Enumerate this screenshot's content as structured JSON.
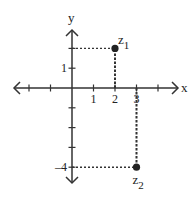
{
  "diagram": {
    "title": "",
    "axes": {
      "x_label": "x",
      "y_label": "y",
      "x_range": [
        -3,
        5
      ],
      "y_range": [
        -5,
        3
      ],
      "x_ticks": [
        -2,
        -1,
        1,
        2,
        3,
        4
      ],
      "y_ticks": [
        -4,
        -3,
        -2,
        -1,
        1,
        2
      ],
      "x_tick_labels": [
        {
          "value": 1,
          "label": "1"
        },
        {
          "value": 2,
          "label": "2"
        },
        {
          "value": 3,
          "label": "3"
        }
      ],
      "y_tick_labels": [
        {
          "value": 1,
          "label": "1"
        },
        {
          "value": -4,
          "label": "-4"
        }
      ]
    },
    "points": [
      {
        "name": "z",
        "subscript": "1",
        "x": 2,
        "y": 2,
        "label_position": "upper-right"
      },
      {
        "name": "z",
        "subscript": "2",
        "x": 3,
        "y": -4,
        "label_position": "below"
      }
    ],
    "colors": {
      "ink": "#222222",
      "background": "#ffffff"
    }
  }
}
